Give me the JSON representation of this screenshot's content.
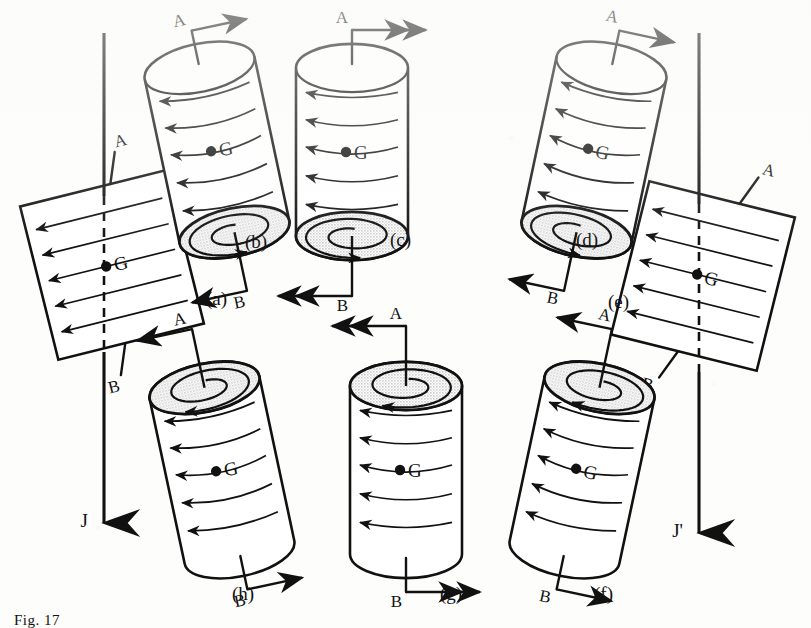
{
  "figure": {
    "caption": "Fig. 17",
    "background_color": "#fdfdfc",
    "ink_color": "#111111",
    "shade_color": "#d7d7d7"
  },
  "axes": [
    {
      "id": "J",
      "label": "J",
      "x": 104,
      "top": 33,
      "bottom": 523,
      "dash_from": 196,
      "dash_to": 352
    },
    {
      "id": "J'",
      "label": "J'",
      "x": 699,
      "top": 33,
      "bottom": 533,
      "dash_from": 204,
      "dash_to": 372
    }
  ],
  "panels": [
    {
      "id": "a",
      "label": "(a)",
      "type": "flat-rectangle",
      "rotation": -14,
      "cx": 112,
      "cy": 265,
      "w": 150,
      "h": 158,
      "center_label": "G",
      "vector_a": "A",
      "vector_b": "B",
      "a_arrow": "none",
      "b_arrow": "none",
      "flow": "left",
      "shaded_end": "none",
      "label_x": 206,
      "label_y": 305
    },
    {
      "id": "b",
      "label": "(b)",
      "type": "cylinder",
      "rotation": -12,
      "cx": 217,
      "cy": 150,
      "w": 112,
      "h": 168,
      "center_label": "G",
      "vector_a": "A",
      "vector_b": "B",
      "a_arrow": "single-right",
      "b_arrow": "single-left",
      "flow": "left",
      "shaded_end": "bottom",
      "spiral": "ccw",
      "label_x": 245,
      "label_y": 248
    },
    {
      "id": "c",
      "label": "(c)",
      "type": "cylinder",
      "rotation": 0,
      "cx": 352,
      "cy": 152,
      "w": 112,
      "h": 168,
      "center_label": "G",
      "vector_a": "A",
      "vector_b": "B",
      "a_arrow": "double-right",
      "b_arrow": "double-left",
      "flow": "left",
      "shaded_end": "bottom",
      "spiral": "ccw",
      "label_x": 390,
      "label_y": 246
    },
    {
      "id": "d",
      "label": "(d)",
      "type": "cylinder",
      "rotation": 12,
      "cx": 594,
      "cy": 150,
      "w": 112,
      "h": 168,
      "center_label": "G",
      "vector_a": "A",
      "vector_b": "B",
      "a_arrow": "single-right",
      "b_arrow": "single-left",
      "flow": "left",
      "shaded_end": "bottom",
      "spiral": "ccw",
      "label_x": 576,
      "label_y": 246
    },
    {
      "id": "e",
      "label": "(e)",
      "type": "flat-rectangle",
      "rotation": 14,
      "cx": 703,
      "cy": 276,
      "w": 150,
      "h": 158,
      "center_label": "G",
      "vector_a": "A",
      "vector_b": "B",
      "a_arrow": "none",
      "b_arrow": "none",
      "flow": "left",
      "shaded_end": "none",
      "label_x": 608,
      "label_y": 308
    },
    {
      "id": "f",
      "label": "(f)",
      "type": "cylinder",
      "rotation": 12,
      "cx": 582,
      "cy": 470,
      "w": 112,
      "h": 168,
      "center_label": "G",
      "vector_a": "A",
      "vector_b": "B",
      "a_arrow": "single-left",
      "b_arrow": "single-right",
      "flow": "left",
      "shaded_end": "top",
      "spiral": "cw",
      "label_x": 594,
      "label_y": 600
    },
    {
      "id": "g",
      "label": "(g)",
      "type": "cylinder",
      "rotation": 0,
      "cx": 406,
      "cy": 470,
      "w": 112,
      "h": 168,
      "center_label": "G",
      "vector_a": "A",
      "vector_b": "B",
      "a_arrow": "double-left",
      "b_arrow": "double-right",
      "flow": "left",
      "shaded_end": "top",
      "spiral": "cw",
      "label_x": 440,
      "label_y": 600
    },
    {
      "id": "h",
      "label": "(h)",
      "type": "cylinder",
      "rotation": -12,
      "cx": 222,
      "cy": 470,
      "w": 112,
      "h": 168,
      "center_label": "G",
      "vector_a": "A",
      "vector_b": "B",
      "a_arrow": "single-left",
      "b_arrow": "single-right",
      "flow": "left",
      "shaded_end": "top",
      "spiral": "cw",
      "label_x": 232,
      "label_y": 600
    }
  ],
  "legend_symbols": {
    "center_of_mass": "G",
    "axis_point_a": "A",
    "axis_point_b": "B",
    "angular_momentum_before": "J",
    "angular_momentum_after": "J'"
  }
}
